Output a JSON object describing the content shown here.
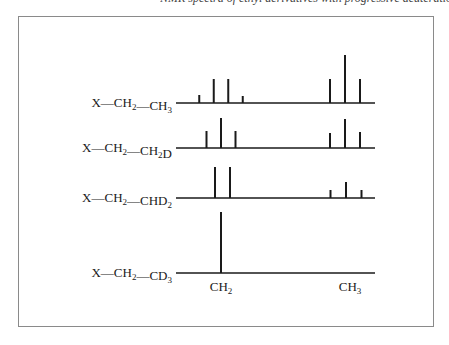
{
  "caption": {
    "text": "NMR spectra of ethyl derivatives with progressive deuteration"
  },
  "chart_data": {
    "type": "stick-spectrum",
    "title": "",
    "xlabel": "",
    "ylabel": "",
    "axis_labels": [
      {
        "group": "CH2",
        "main": "CH",
        "sub": "2"
      },
      {
        "group": "CH3",
        "main": "CH",
        "sub": "3"
      }
    ],
    "spectra": [
      {
        "name": "X—CH2—CH3",
        "label_parts": [
          {
            "t": "X—CH",
            "sub": false
          },
          {
            "t": "2",
            "sub": true
          },
          {
            "t": "—CH",
            "sub": false
          },
          {
            "t": "3",
            "sub": true
          }
        ],
        "groups": [
          {
            "group": "CH2",
            "multiplicity": "quartet",
            "positions": [
              -1.5,
              -0.5,
              0.5,
              1.5
            ],
            "intensities": [
              1,
              3,
              3,
              1
            ]
          },
          {
            "group": "CH3",
            "multiplicity": "triplet",
            "positions": [
              -1,
              0,
              1
            ],
            "intensities": [
              1,
              2,
              1
            ]
          }
        ]
      },
      {
        "name": "X—CH2—CH2D",
        "label_parts": [
          {
            "t": "X—CH",
            "sub": false
          },
          {
            "t": "2",
            "sub": true
          },
          {
            "t": "—CH",
            "sub": false
          },
          {
            "t": "2",
            "sub": true
          },
          {
            "t": "D",
            "sub": false
          }
        ],
        "groups": [
          {
            "group": "CH2",
            "multiplicity": "triplet",
            "positions": [
              -1,
              0,
              1
            ],
            "intensities": [
              1,
              2,
              1
            ]
          },
          {
            "group": "CH2D",
            "multiplicity": "triplet",
            "positions": [
              -1,
              0,
              1
            ],
            "intensities": [
              1,
              2,
              1
            ]
          }
        ]
      },
      {
        "name": "X—CH2—CHD2",
        "label_parts": [
          {
            "t": "X—CH",
            "sub": false
          },
          {
            "t": "2",
            "sub": true
          },
          {
            "t": "—CHD",
            "sub": false
          },
          {
            "t": "2",
            "sub": true
          }
        ],
        "groups": [
          {
            "group": "CH2",
            "multiplicity": "doublet",
            "positions": [
              -0.5,
              0.5
            ],
            "intensities": [
              1,
              1
            ]
          },
          {
            "group": "CHD2",
            "multiplicity": "triplet",
            "positions": [
              -1,
              0,
              1
            ],
            "intensities": [
              1,
              2,
              1
            ]
          }
        ]
      },
      {
        "name": "X—CH2—CD3",
        "label_parts": [
          {
            "t": "X—CH",
            "sub": false
          },
          {
            "t": "2",
            "sub": true
          },
          {
            "t": "—CD",
            "sub": false
          },
          {
            "t": "3",
            "sub": true
          }
        ],
        "groups": [
          {
            "group": "CH2",
            "multiplicity": "singlet",
            "positions": [
              0
            ],
            "intensities": [
              1
            ]
          }
        ]
      }
    ],
    "relative_heights": {
      "row1": {
        "CH2": [
          8,
          24,
          24,
          7
        ],
        "CH3": [
          24,
          48,
          24
        ]
      },
      "row2": {
        "CH2": [
          17,
          30,
          17
        ],
        "CH3": [
          15,
          29,
          16
        ]
      },
      "row3": {
        "CH2": [
          31,
          31
        ],
        "CH3": [
          8,
          16,
          8
        ]
      },
      "row4": {
        "CH2": [
          61
        ]
      }
    }
  }
}
